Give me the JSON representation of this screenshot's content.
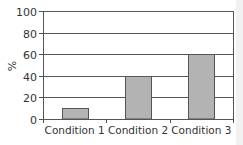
{
  "chart_data": {
    "type": "bar",
    "title": "",
    "xlabel": "",
    "ylabel": "%",
    "categories": [
      "Condition 1",
      "Condition 2",
      "Condition 3"
    ],
    "values": [
      10,
      40,
      60
    ],
    "ylim": [
      0,
      100
    ],
    "yticks": [
      0,
      20,
      40,
      60,
      80,
      100
    ],
    "grid": true,
    "legend": null,
    "colors": {
      "bar_fill": "#b3b3b3",
      "bar_stroke": "#555555",
      "grid": "#555555",
      "axis": "#555555",
      "text": "#333333"
    }
  }
}
